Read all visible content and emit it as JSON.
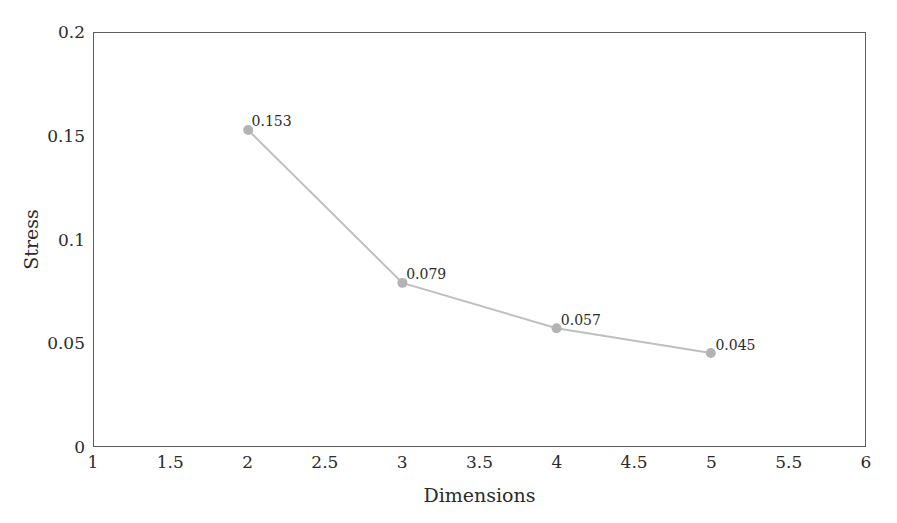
{
  "chart_data": {
    "type": "line",
    "title": "",
    "xlabel": "Dimensions",
    "ylabel": "Stress",
    "xlim": [
      1,
      6
    ],
    "ylim": [
      0,
      0.2
    ],
    "grid": false,
    "legend": null,
    "xticks": [
      "1",
      "1.5",
      "2",
      "2.5",
      "3",
      "3.5",
      "4",
      "4.5",
      "5",
      "5.5",
      "6"
    ],
    "xtick_values": [
      1,
      1.5,
      2,
      2.5,
      3,
      3.5,
      4,
      4.5,
      5,
      5.5,
      6
    ],
    "yticks": [
      "0",
      "0.05",
      "0.1",
      "0.15",
      "0.2"
    ],
    "ytick_values": [
      0,
      0.05,
      0.1,
      0.15,
      0.2
    ],
    "x": [
      2,
      3,
      4,
      5
    ],
    "values": [
      0.153,
      0.079,
      0.057,
      0.045
    ],
    "point_labels": [
      "0.153",
      "0.079",
      "0.057",
      "0.045"
    ],
    "series": [
      {
        "name": "Stress",
        "x": [
          2,
          3,
          4,
          5
        ],
        "values": [
          0.153,
          0.079,
          0.057,
          0.045
        ]
      }
    ],
    "colors": {
      "line": "#bfbfbf",
      "marker": "#b3b3b3",
      "frame": "#5d5d5d",
      "text": "#2b2b2b",
      "background": "#ffffff"
    },
    "style": {
      "marker": "circle",
      "marker_radius": 5,
      "line_width": 2
    }
  }
}
